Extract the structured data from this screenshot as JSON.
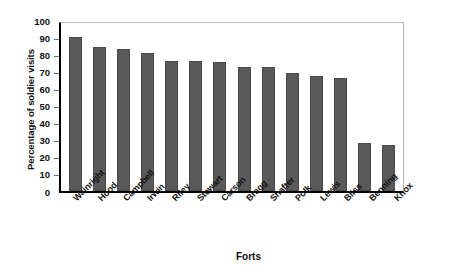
{
  "chart_data": {
    "type": "bar",
    "title": "",
    "xlabel": "Forts",
    "ylabel": "Percentage of soldier visits",
    "categories": [
      "Wainright",
      "Hood",
      "Campbell",
      "Irwin",
      "Riley",
      "Stewart",
      "Carson",
      "Bragg",
      "Shafter",
      "Polk",
      "Lewis",
      "Bliss",
      "Benning",
      "Knox"
    ],
    "values": [
      90,
      84,
      83,
      81,
      76,
      76,
      75.5,
      72.5,
      72.5,
      69,
      67,
      66,
      28,
      27
    ],
    "ylim": [
      0,
      100
    ],
    "ytick_labels": [
      "0",
      "10",
      "20",
      "30",
      "40",
      "50",
      "60",
      "70",
      "80",
      "90",
      "100"
    ],
    "ytick_values": [
      0,
      10,
      20,
      30,
      40,
      50,
      60,
      70,
      80,
      90,
      100
    ],
    "grid": false,
    "legend": "none",
    "bar_color": "#595959",
    "axis_color": "#000000",
    "frame_color": "#b9b9b9"
  }
}
